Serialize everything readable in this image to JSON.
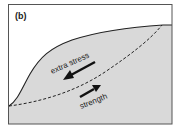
{
  "panel_label": "(b)",
  "labels": {
    "extra_stress": "extra stress",
    "strength": "strength"
  },
  "colors": {
    "slope_fill": "#d9d9d9",
    "line": "#222222",
    "frame": "#555555",
    "background": "#ffffff"
  }
}
